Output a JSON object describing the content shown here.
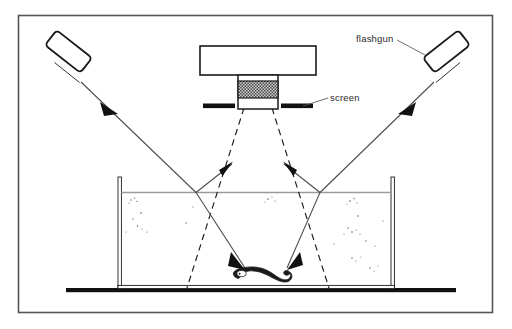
{
  "figure": {
    "border_color": "#4a4a4a",
    "background_color": "#ffffff",
    "ink_color": "#1a1a1a"
  },
  "labels": {
    "flashgun": "flashgun",
    "screen": "screen"
  },
  "components": {
    "camera_body": "camera-body",
    "lens_barrel": "lens-barrel",
    "lens_grip_band": "lens-grip-band",
    "screen_left": "screen-bar-left",
    "screen_right": "screen-bar-right",
    "flashgun_left": "flashgun-left",
    "flashgun_right": "flashgun-right",
    "tank": "water-tank",
    "water_surface": "water-surface-line",
    "baseline": "bench-baseline",
    "larva": "fish-larva",
    "field_of_view": "camera-field-of-view-cone",
    "light_ray_left": "light-ray-left",
    "light_ray_right": "light-ray-right",
    "particles": "suspended-particles"
  },
  "colors": {
    "solid_black": "#111111",
    "hatch_gray": "#8f8f8f",
    "ray_gray": "#4d4d4d",
    "water_line": "#9a9a9a",
    "frame": "#555555"
  }
}
